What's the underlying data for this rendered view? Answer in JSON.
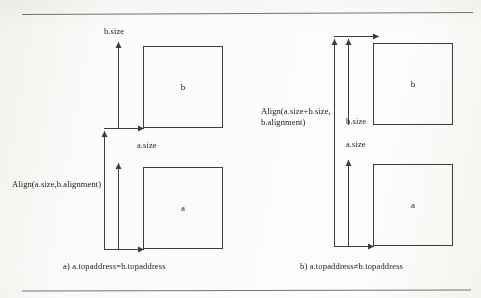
{
  "figure": {
    "background_color": "#fbfaf8",
    "ink_color": "#3c3c3c",
    "rule_color": "#4a4a4a"
  },
  "panels": [
    {
      "id": "a",
      "caption": "a) a.topaddress=b.topaddress",
      "boxes": [
        {
          "label": "b"
        },
        {
          "label": "a"
        }
      ],
      "measures": [
        {
          "name": "b-size",
          "label": "b.size"
        },
        {
          "name": "a-size",
          "label": "a.size"
        },
        {
          "name": "align",
          "label": "Align(a.size,b.alignment)"
        }
      ]
    },
    {
      "id": "b",
      "caption": "b) a.topaddress≠b.topaddress",
      "boxes": [
        {
          "label": "b"
        },
        {
          "label": "a"
        }
      ],
      "measures": [
        {
          "name": "b-size",
          "label": "b.size"
        },
        {
          "name": "a-size",
          "label": "a.size"
        },
        {
          "name": "align",
          "label_line1": "Align(a.size+b.size,",
          "label_line2": "b.alignment)"
        }
      ]
    }
  ]
}
